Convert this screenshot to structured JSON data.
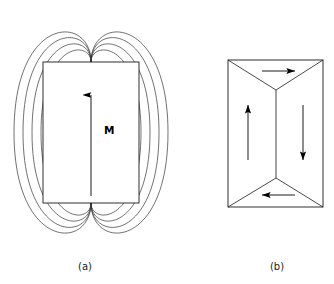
{
  "figure": {
    "title": "",
    "background_color": "#ffffff",
    "stroke_color": "#1a1a1a",
    "panels": [
      {
        "id": "panel-a",
        "caption": "(a)",
        "caption_x": 85,
        "caption_y": 270,
        "description": "single-domain ferromagnet with external stray field lines",
        "body": {
          "shape": "rectangle",
          "x": 43,
          "y": 62,
          "width": 96,
          "height": 141
        },
        "magnetization_label": "M",
        "magnetization_label_x": 104,
        "magnetization_label_y": 134,
        "magnetization_arrow": {
          "x": 91,
          "y_tail": 196,
          "y_head": 92,
          "direction": "up"
        },
        "field_lines": [
          {
            "index": 1,
            "half_width": 77,
            "top": 14,
            "bottom": 251
          },
          {
            "index": 2,
            "half_width": 68,
            "top": 22,
            "bottom": 243
          },
          {
            "index": 3,
            "half_width": 59,
            "top": 31,
            "bottom": 234
          },
          {
            "index": 4,
            "half_width": 50,
            "top": 40,
            "bottom": 225
          }
        ],
        "pole_top_x": 91,
        "pole_top_y": 62,
        "pole_bottom_x": 91,
        "pole_bottom_y": 203
      },
      {
        "id": "panel-b",
        "caption": "(b)",
        "caption_x": 277,
        "caption_y": 270,
        "description": "flux-closure four-domain structure with closure domains",
        "body": {
          "shape": "rectangle",
          "x": 228,
          "y": 60,
          "width": 95,
          "height": 147
        },
        "domain_walls": [
          {
            "name": "top-left-wall",
            "x1": 228,
            "y1": 60,
            "x2": 276,
            "y2": 90
          },
          {
            "name": "top-right-wall",
            "x1": 323,
            "y1": 60,
            "x2": 276,
            "y2": 90
          },
          {
            "name": "center-wall",
            "x1": 276,
            "y1": 90,
            "x2": 276,
            "y2": 178
          },
          {
            "name": "bottom-left-wall",
            "x1": 228,
            "y1": 207,
            "x2": 276,
            "y2": 178
          },
          {
            "name": "bottom-right-wall",
            "x1": 323,
            "y1": 207,
            "x2": 276,
            "y2": 178
          }
        ],
        "domain_arrows": [
          {
            "name": "top-closure-arrow",
            "direction": "right",
            "x_tail": 262,
            "x_head": 295,
            "y": 71
          },
          {
            "name": "left-domain-arrow",
            "direction": "up",
            "x": 248,
            "y_tail": 160,
            "y_head": 105
          },
          {
            "name": "right-domain-arrow",
            "direction": "down",
            "x": 303,
            "y_tail": 105,
            "y_head": 160
          },
          {
            "name": "bottom-closure-arrow",
            "direction": "left",
            "x_tail": 295,
            "x_head": 262,
            "y": 195
          }
        ]
      }
    ]
  }
}
